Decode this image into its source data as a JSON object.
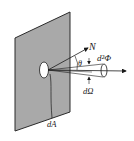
{
  "diagram": {
    "type": "radiance-geometry",
    "labels": {
      "normal": "N",
      "angle": "θ",
      "flux": "d²Φ",
      "solid_angle": "dΩ",
      "area": "dA"
    },
    "colors": {
      "panel_fill": "#a9a9a9",
      "panel_edge": "#2a2a2a",
      "line": "#1a1a1a",
      "spot": "#ffffff"
    }
  }
}
